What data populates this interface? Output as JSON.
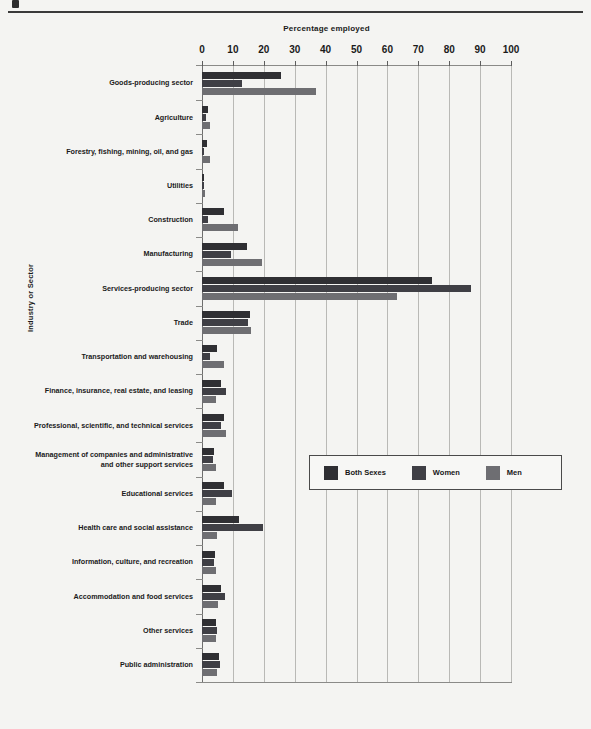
{
  "chart_data": {
    "type": "bar",
    "orientation": "horizontal",
    "title": "",
    "xlabel": "Percentage employed",
    "ylabel": "Industry or Sector",
    "xlim": [
      0,
      100
    ],
    "xticks": [
      0,
      10,
      20,
      30,
      40,
      50,
      60,
      70,
      80,
      90,
      100
    ],
    "grid": true,
    "legend_position": "middle-right",
    "categories": [
      "Goods-producing sector",
      "Agriculture",
      "Forestry, fishing, mining, oil, and gas",
      "Utilities",
      "Construction",
      "Manufacturing",
      "Services-producing sector",
      "Trade",
      "Transportation and warehousing",
      "Finance, insurance, real estate, and leasing",
      "Professional, scientific, and technical services",
      "Management of companies and administrative\nand other support services",
      "Educational services",
      "Health care and social assistance",
      "Information, culture, and recreation",
      "Accommodation and food services",
      "Other services",
      "Public administration"
    ],
    "series": [
      {
        "name": "Both Sexes",
        "color": "#2f2f33",
        "values": [
          25.5,
          2.0,
          1.6,
          0.8,
          7.0,
          14.5,
          74.5,
          15.5,
          5.0,
          6.2,
          7.0,
          4.0,
          7.0,
          12.0,
          4.2,
          6.3,
          4.6,
          5.4
        ]
      },
      {
        "name": "Women",
        "color": "#3f3f45",
        "values": [
          13.0,
          1.3,
          0.6,
          0.5,
          1.8,
          9.5,
          87.0,
          15.0,
          2.6,
          7.8,
          6.0,
          3.6,
          9.8,
          19.7,
          4.0,
          7.4,
          4.8,
          5.8
        ]
      },
      {
        "name": "Men",
        "color": "#6e6e72",
        "values": [
          37.0,
          2.7,
          2.5,
          1.1,
          11.8,
          19.4,
          63.0,
          16.0,
          7.1,
          4.6,
          7.9,
          4.4,
          4.6,
          5.0,
          4.4,
          5.3,
          4.4,
          5.0
        ]
      }
    ]
  },
  "legend": {
    "items": [
      {
        "label": "Both Sexes"
      },
      {
        "label": "Women"
      },
      {
        "label": "Men"
      }
    ]
  }
}
